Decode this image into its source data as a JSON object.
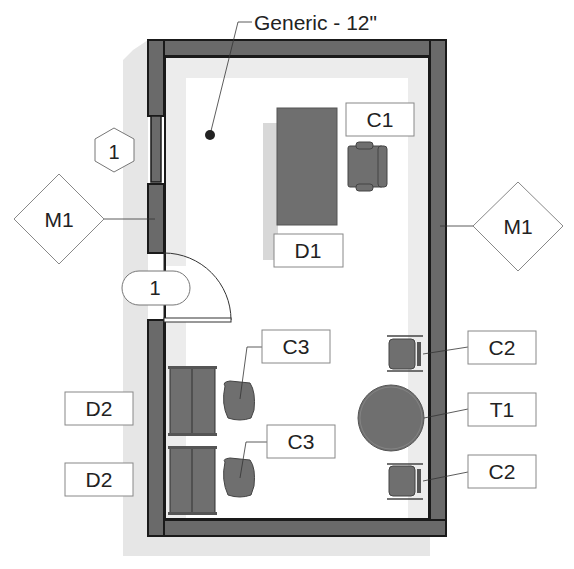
{
  "diagram": {
    "type": "floor_plan",
    "wall_tag": "Generic - 12\"",
    "window_tag": "1",
    "door_tag": "1",
    "material_tags": [
      {
        "id": "M1",
        "side": "left"
      },
      {
        "id": "M1",
        "side": "right"
      }
    ],
    "furniture_tags": {
      "desk_main": "D1",
      "chair_main": "C1",
      "desks_side": [
        "D2",
        "D2"
      ],
      "chairs_side": [
        "C3",
        "C3"
      ],
      "chairs_table": [
        "C2",
        "C2"
      ],
      "table": "T1"
    },
    "colors": {
      "wall_fill": "#6a6a6a",
      "wall_outline": "#1a1a1a",
      "furniture_fill": "#6f6f6f",
      "shadow": "#e4e4e4",
      "tag_border": "#888888",
      "text": "#222222"
    }
  }
}
